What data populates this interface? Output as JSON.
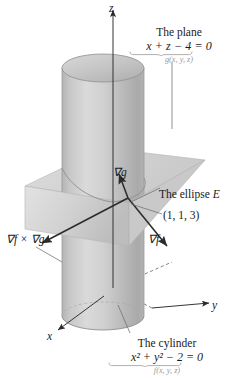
{
  "figure": {
    "background": "#ffffff"
  },
  "axes": {
    "x": {
      "label": "x",
      "direction": "down-left"
    },
    "y": {
      "label": "y",
      "direction": "right-down"
    },
    "z": {
      "label": "z",
      "direction": "up"
    },
    "origin": {
      "x": 113,
      "y": 288
    }
  },
  "surfaces": {
    "cylinder": {
      "caption": "The cylinder",
      "equation": "x² + y² − 2 = 0",
      "equation_parts": {
        "lhs_a": "x",
        "exp_a": "2",
        "plus": "+",
        "lhs_b": "y",
        "exp_b": "2",
        "rest": "− 2 = 0"
      },
      "function_label": "f(x, y, z)",
      "fill": "#c6c6c6",
      "edge": "#8a8a8a"
    },
    "plane": {
      "caption": "The plane",
      "equation": "x + z − 4 = 0",
      "function_label": "g(x, y, z)",
      "fill": "#d2d2d2",
      "edge": "#9c9c9c"
    }
  },
  "curve": {
    "label": "The ellipse E",
    "label_text": "The ellipse ",
    "label_italic": "E"
  },
  "point": {
    "label": "(1, 1, 3)",
    "coords": [
      1,
      1,
      3
    ]
  },
  "vectors": [
    {
      "name": "grad-g",
      "label": "∇g",
      "from": [
        128,
        198
      ],
      "to": [
        120,
        176
      ],
      "direction": "up-left"
    },
    {
      "name": "grad-f",
      "label": "∇f",
      "from": [
        128,
        198
      ],
      "to": [
        166,
        245
      ],
      "direction": "down-right"
    },
    {
      "name": "grad-f-cross-grad-g",
      "label": "∇f × ∇g",
      "from": [
        128,
        198
      ],
      "to": [
        44,
        243
      ],
      "direction": "down-left"
    }
  ],
  "colors": {
    "ink": "#1a1a1a",
    "faint_ink": "#9a9a9a",
    "cylinder_light": "#dcdcdc",
    "cylinder_mid": "#c2c2c2",
    "cylinder_dark": "#a9a9a9",
    "plane_light": "#dedede",
    "plane_dark": "#c0c0c0",
    "arrow": "#2b2b2b",
    "leader": "#6e6e6e"
  }
}
